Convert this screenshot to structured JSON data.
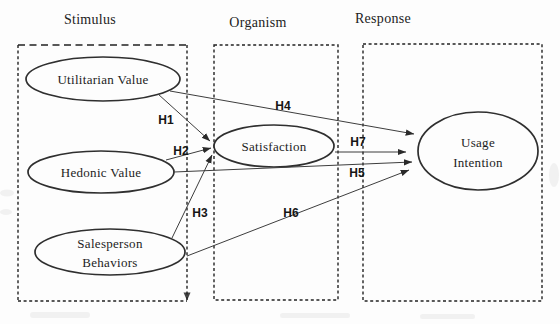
{
  "diagram": {
    "sections": [
      {
        "id": "stimulus",
        "label": "Stimulus"
      },
      {
        "id": "organism",
        "label": "Organism"
      },
      {
        "id": "response",
        "label": "Response"
      }
    ],
    "nodes": [
      {
        "id": "utilitarian-value",
        "section": "Stimulus",
        "lines": [
          "Utilitarian Value"
        ]
      },
      {
        "id": "hedonic-value",
        "section": "Stimulus",
        "lines": [
          "Hedonic Value"
        ]
      },
      {
        "id": "salesperson-behaviors",
        "section": "Stimulus",
        "lines": [
          "Salesperson",
          "Behaviors"
        ]
      },
      {
        "id": "satisfaction",
        "section": "Organism",
        "lines": [
          "Satisfaction"
        ]
      },
      {
        "id": "usage-intention",
        "section": "Response",
        "lines": [
          "Usage",
          "Intention"
        ]
      }
    ],
    "hypotheses": [
      {
        "label": "H1",
        "from": "Utilitarian Value",
        "to": "Satisfaction"
      },
      {
        "label": "H2",
        "from": "Hedonic Value",
        "to": "Satisfaction"
      },
      {
        "label": "H3",
        "from": "Salesperson Behaviors",
        "to": "Satisfaction"
      },
      {
        "label": "H4",
        "from": "Utilitarian Value",
        "to": "Usage Intention"
      },
      {
        "label": "H5",
        "from": "Hedonic Value",
        "to": "Usage Intention"
      },
      {
        "label": "H6",
        "from": "Salesperson Behaviors",
        "to": "Usage Intention"
      },
      {
        "label": "H7",
        "from": "Satisfaction",
        "to": "Usage Intention"
      }
    ],
    "colors": {
      "ink": "#222222",
      "line": "#3d3d3d",
      "background": "#fdfdfd"
    }
  }
}
